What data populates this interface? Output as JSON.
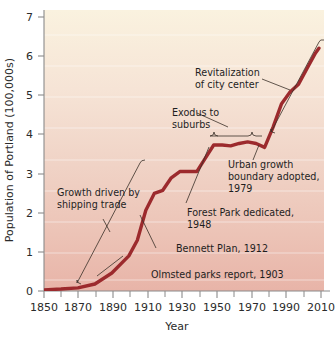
{
  "chart_data": {
    "type": "line",
    "title": "",
    "xlabel": "Year",
    "ylabel": "Population of Portland (100,000s)",
    "xlim": [
      1850,
      2015
    ],
    "ylim": [
      0,
      7.2
    ],
    "xticks": [
      1850,
      1870,
      1890,
      1910,
      1930,
      1950,
      1970,
      1990,
      2010
    ],
    "xticks_minor": [
      1860,
      1880,
      1900,
      1920,
      1940,
      1960,
      1980,
      2000
    ],
    "yticks": [
      0,
      1,
      2,
      3,
      4,
      5,
      6,
      7
    ],
    "grid": "horizontal-white-bands",
    "legend": "none",
    "series": [
      {
        "name": "Population of Portland",
        "color": "#9c2a2d",
        "x": [
          1850,
          1860,
          1870,
          1880,
          1890,
          1900,
          1905,
          1910,
          1915,
          1920,
          1925,
          1930,
          1935,
          1940,
          1945,
          1950,
          1955,
          1960,
          1965,
          1970,
          1975,
          1980,
          1985,
          1990,
          1995,
          2000,
          2005,
          2010,
          2012
        ],
        "y": [
          0.03,
          0.05,
          0.08,
          0.18,
          0.46,
          0.9,
          1.3,
          2.07,
          2.5,
          2.58,
          2.9,
          3.06,
          3.06,
          3.06,
          3.4,
          3.74,
          3.74,
          3.72,
          3.78,
          3.82,
          3.78,
          3.68,
          4.2,
          4.8,
          5.1,
          5.3,
          5.7,
          6.1,
          6.22
        ]
      }
    ],
    "annotations": [
      {
        "id": "revitalization",
        "lines": [
          "Revitalization",
          "of city center"
        ],
        "target_year": 1993,
        "target_value": 5.05
      },
      {
        "id": "exodus",
        "lines": [
          "Exodus to",
          "suburbs"
        ],
        "target_year": 1965,
        "target_value": 3.95,
        "bracket_span_years": [
          1951,
          1980
        ]
      },
      {
        "id": "urban-growth-boundary",
        "lines": [
          "Urban growth",
          "boundary adopted,",
          "1979"
        ],
        "target_year": 1979,
        "target_value": 3.68
      },
      {
        "id": "forest-park",
        "lines": [
          "Forest Park dedicated,",
          "1948"
        ],
        "target_year": 1948,
        "target_value": 3.6
      },
      {
        "id": "bennett-plan",
        "lines": [
          "Bennett Plan, 1912"
        ],
        "target_year": 1912,
        "target_value": 2.2
      },
      {
        "id": "olmsted-parks",
        "lines": [
          "Olmsted parks report, 1903"
        ],
        "target_year": 1903,
        "target_value": 1.05
      },
      {
        "id": "shipping-trade",
        "lines": [
          "Growth driven by",
          "shipping trade"
        ],
        "target_year": 1925,
        "target_value": 3.05,
        "bracket_span_years": [
          1868,
          1925
        ]
      }
    ],
    "colors": {
      "line": "#9c2a2d",
      "bg_top": "#faf1dd",
      "bg_bottom": "#e9b9ae",
      "axis": "#8a8a8a",
      "text": "#2b2b2b",
      "leader": "#3a3028"
    }
  },
  "axis": {
    "y_title": "Population of Portland (100,000s)",
    "x_title": "Year",
    "y_tick_0": "0",
    "y_tick_1": "1",
    "y_tick_2": "2",
    "y_tick_3": "3",
    "y_tick_4": "4",
    "y_tick_5": "5",
    "y_tick_6": "6",
    "y_tick_7": "7",
    "x_tick_1850": "1850",
    "x_tick_1870": "1870",
    "x_tick_1890": "1890",
    "x_tick_1910": "1910",
    "x_tick_1930": "1930",
    "x_tick_1950": "1950",
    "x_tick_1970": "1970",
    "x_tick_1990": "1990",
    "x_tick_2010": "2010"
  },
  "annotations_text": {
    "revitalization_l1": "Revitalization",
    "revitalization_l2": "of city center",
    "exodus_l1": "Exodus to",
    "exodus_l2": "suburbs",
    "ugb_l1": "Urban growth",
    "ugb_l2": "boundary adopted,",
    "ugb_l3": "1979",
    "forest_l1": "Forest Park dedicated,",
    "forest_l2": "1948",
    "bennett_l1": "Bennett Plan, 1912",
    "olmsted_l1": "Olmsted parks report, 1903",
    "shipping_l1": "Growth driven by",
    "shipping_l2": "shipping trade"
  }
}
